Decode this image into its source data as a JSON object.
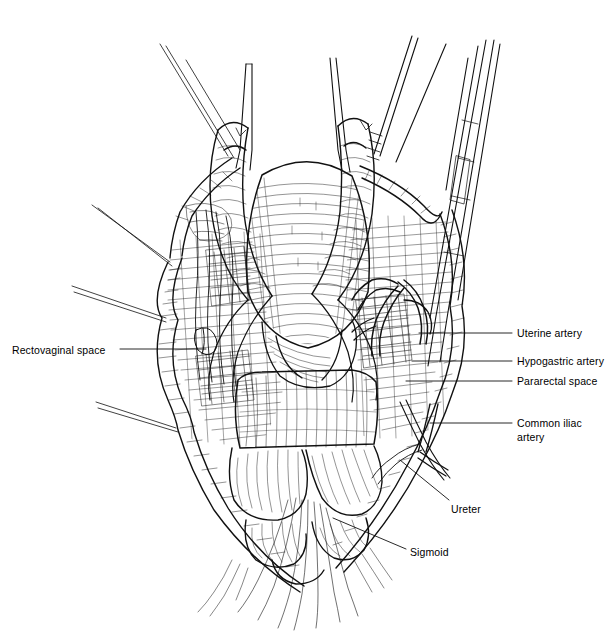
{
  "illustration": {
    "title": "Pelvic dissection: rectovaginal and pararectal spaces",
    "style": "pen-and-ink line engraving",
    "background_color": "#ffffff",
    "ink_color": "#000000"
  },
  "labels": [
    {
      "id": "rectovaginal-space",
      "text": "Rectovaginal space",
      "side": "left",
      "x": 12,
      "y": 344,
      "leader": {
        "x1": 120,
        "y1": 349,
        "x2": 206,
        "y2": 349
      }
    },
    {
      "id": "uterine-artery",
      "text": "Uterine artery",
      "side": "right",
      "x": 517,
      "y": 327,
      "leader": {
        "x1": 419,
        "y1": 333,
        "x2": 512,
        "y2": 333
      }
    },
    {
      "id": "hypogastric-artery",
      "text": "Hypogastric artery",
      "side": "right",
      "x": 517,
      "y": 355,
      "leader": {
        "x1": 412,
        "y1": 361,
        "x2": 512,
        "y2": 361
      }
    },
    {
      "id": "pararectal-space",
      "text": "Pararectal space",
      "side": "right",
      "x": 517,
      "y": 375,
      "leader": {
        "x1": 406,
        "y1": 381,
        "x2": 512,
        "y2": 381
      }
    },
    {
      "id": "common-iliac-artery",
      "text": "Common iliac",
      "text2": "artery",
      "side": "right",
      "x": 517,
      "y": 417,
      "leader": {
        "x1": 430,
        "y1": 423,
        "x2": 512,
        "y2": 423
      }
    },
    {
      "id": "ureter",
      "text": "Ureter",
      "side": "right",
      "x": 451,
      "y": 503,
      "leader": {
        "x1": 400,
        "y1": 460,
        "x2": 449,
        "y2": 500
      }
    },
    {
      "id": "sigmoid",
      "text": "Sigmoid",
      "side": "right",
      "x": 410,
      "y": 546,
      "leader": {
        "x1": 333,
        "y1": 518,
        "x2": 406,
        "y2": 549
      }
    }
  ],
  "structures": [
    "uterus corpus",
    "round ligaments",
    "clamped adnexal pedicles",
    "broad ligament leaves",
    "pelvic sidewall vessels",
    "ureter",
    "sigmoid colon",
    "rectum",
    "abdominal wall retraction sutures",
    "self-retaining retractor blade"
  ]
}
